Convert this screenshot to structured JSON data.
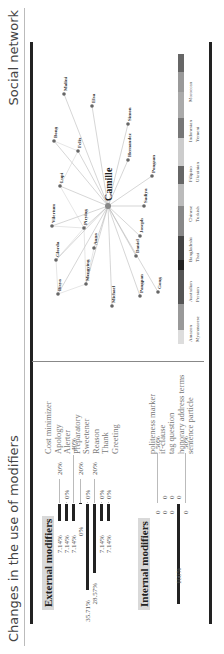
{
  "header": {
    "left_title": "Changes in the use of modifiers",
    "right_title": "Social network"
  },
  "external": {
    "heading": "External modifiers",
    "rows": [
      {
        "left": "7.14%",
        "right": "20%",
        "axis": ""
      },
      {
        "left": "7.14%",
        "right": "0%",
        "axis": ""
      },
      {
        "left": "7.14%",
        "right": "40%",
        "axis": ""
      },
      {
        "left": "0%",
        "right": "20%",
        "axis": ""
      },
      {
        "left": "35.71%",
        "right": "0%",
        "axis": ""
      },
      {
        "left": "28.57%",
        "right": "20%",
        "axis": ""
      },
      {
        "left": "7.14%",
        "right": "0%",
        "axis": ""
      },
      {
        "left": "7.14%",
        "right": "0%",
        "axis": ""
      }
    ],
    "labels": [
      "Cost minimizer",
      "Apology",
      "Alerter",
      "Preparatory",
      "Sweetener",
      "Reason",
      "Thank",
      "Greeting"
    ]
  },
  "internal": {
    "heading": "Internal modifiers",
    "rows": [
      {
        "left": "0",
        "right": "50%"
      },
      {
        "left": "0",
        "right": "0"
      },
      {
        "left": "0",
        "right": "0"
      },
      {
        "left": "100%",
        "right": "0"
      },
      {
        "left": "0",
        "right": "50%"
      }
    ],
    "labels": [
      "politeness marker",
      "if-clause",
      "tag question",
      "honorary address terms",
      "sentence particle"
    ]
  },
  "network": {
    "center": "Camille",
    "nodes": [
      "Malini",
      "Elsa",
      "Simon",
      "Bong",
      "Felix",
      "Hernandez",
      "Pongsan",
      "Lupi",
      "Sadiya",
      "Vilertum",
      "Joseph",
      "Pirying",
      "Daniel",
      "Glorda",
      "Anna",
      "Bisya",
      "Mengying",
      "Michael",
      "Pangpan",
      "Gong"
    ]
  },
  "legend": {
    "row1": [
      "Amazon",
      "Australian",
      "Bangladeshi",
      "Chinese",
      "Filipino",
      "Indonesian",
      "Moroccan"
    ],
    "row2": [
      "Myanmarese",
      "Persian",
      "Thai",
      "Turkish",
      "Ukrainian",
      "Yemeni"
    ],
    "colors": [
      "#ddd",
      "#999",
      "#555",
      "#222",
      "#444",
      "#888",
      "#bbb",
      "#666",
      "#ccc",
      "#777",
      "#aaa",
      "#999",
      "#666"
    ]
  },
  "chart_data": [
    {
      "type": "bar",
      "title": "External modifiers",
      "categories": [
        "Cost minimizer",
        "Apology",
        "Alerter",
        "Preparatory",
        "Sweetener",
        "Reason",
        "Thank",
        "Greeting"
      ],
      "series": [
        {
          "name": "left",
          "values": [
            7.14,
            7.14,
            7.14,
            0,
            35.71,
            28.57,
            7.14,
            7.14
          ]
        },
        {
          "name": "right",
          "values": [
            20,
            0,
            40,
            20,
            0,
            20,
            0,
            0
          ]
        }
      ],
      "ylabel": "%"
    },
    {
      "type": "bar",
      "title": "Internal modifiers",
      "categories": [
        "politeness marker",
        "if-clause",
        "tag question",
        "honorary address terms",
        "sentence particle"
      ],
      "series": [
        {
          "name": "left",
          "values": [
            0,
            0,
            0,
            100,
            0
          ]
        },
        {
          "name": "right",
          "values": [
            50,
            0,
            0,
            0,
            50
          ]
        }
      ],
      "ylabel": "%"
    }
  ]
}
